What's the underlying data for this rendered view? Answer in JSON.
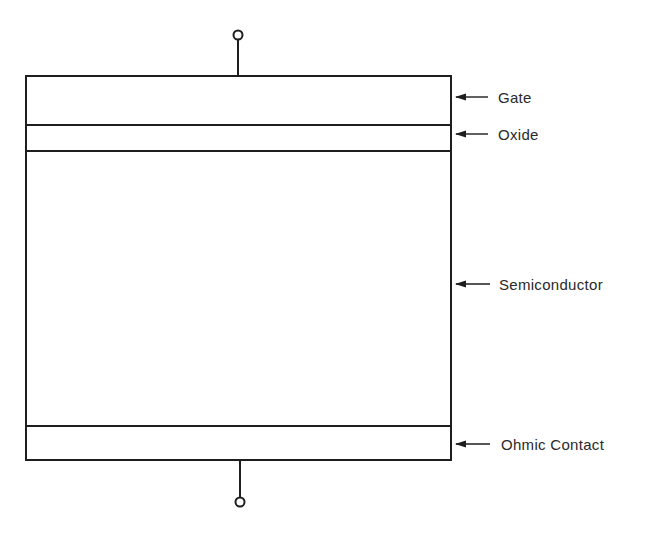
{
  "diagram": {
    "layers": [
      {
        "id": "gate",
        "label": "Gate"
      },
      {
        "id": "oxide",
        "label": "Oxide"
      },
      {
        "id": "semiconductor",
        "label": "Semiconductor"
      },
      {
        "id": "ohmic-contact",
        "label": "Ohmic Contact"
      }
    ],
    "terminals": [
      "top-terminal",
      "bottom-terminal"
    ],
    "colors": {
      "line": "#1e1e1e",
      "text": "#2a2a2a",
      "background": "#ffffff"
    }
  }
}
